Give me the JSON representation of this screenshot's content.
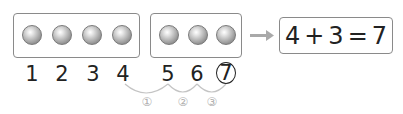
{
  "group_a": {
    "count": 4,
    "color": "#9a9a9a"
  },
  "group_b": {
    "count": 3,
    "color": "#9a9a9a"
  },
  "arrow": {
    "color": "#a9a9a9"
  },
  "equation": {
    "text": "4+3=7",
    "left": "4",
    "op": "+",
    "right": "3",
    "eq": "=",
    "result": "7"
  },
  "number_line": {
    "numbers": [
      "1",
      "2",
      "3",
      "4",
      "5",
      "6",
      "7"
    ],
    "circled_index": 6
  },
  "steps": {
    "labels": [
      "①",
      "②",
      "③"
    ],
    "color": "#b0b0b0"
  }
}
